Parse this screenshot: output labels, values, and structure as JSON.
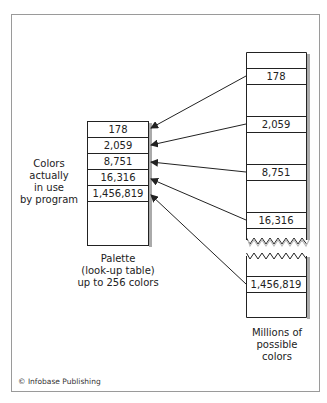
{
  "palette": {
    "rows": [
      "178",
      "2,059",
      "8,751",
      "16,316",
      "1,456,819"
    ],
    "caption": [
      "Palette",
      "(look-up table)",
      "up to 256 colors"
    ]
  },
  "left_label": [
    "Colors",
    "actually",
    "in use",
    "by program"
  ],
  "possible_colors": {
    "rows": [
      "178",
      "2,059",
      "8,751",
      "16,316",
      "1,456,819"
    ],
    "caption": [
      "Millions of",
      "possible",
      "colors"
    ]
  },
  "copyright": "© Infobase Publishing"
}
